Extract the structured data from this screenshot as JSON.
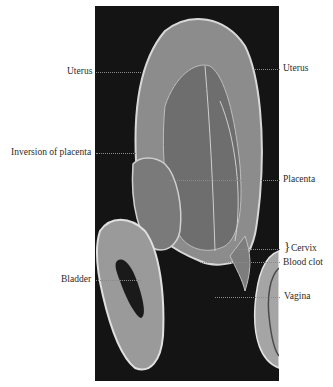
{
  "figure": {
    "type": "anatomical-photograph",
    "background_color": "#141414",
    "labels": {
      "uterus_left": "Uterus",
      "uterus_right": "Uterus",
      "inversion_of_placenta": "Inversion of placenta",
      "placenta": "Placenta",
      "cervix": "Cervix",
      "cervix_brace": "}",
      "blood_clot": "Blood clot",
      "bladder": "Bladder",
      "vagina": "Vagina"
    }
  }
}
